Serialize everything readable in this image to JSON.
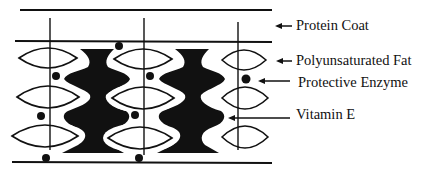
{
  "diagram": {
    "colors": {
      "ink": "#111111",
      "background": "#ffffff"
    },
    "labels": [
      {
        "id": "protein-coat",
        "text": "Protein Coat",
        "x": 296,
        "y": 18,
        "arrow": {
          "x1": 292,
          "y1": 26,
          "x2": 275,
          "y2": 26
        }
      },
      {
        "id": "polyunsaturated-fat",
        "text": "Polyunsaturated Fat",
        "x": 296,
        "y": 53,
        "arrow": {
          "x1": 292,
          "y1": 61,
          "x2": 276,
          "y2": 61
        }
      },
      {
        "id": "protective-enzyme",
        "text": "Protective Enzyme",
        "x": 298,
        "y": 75,
        "arrow": {
          "x1": 290,
          "y1": 81,
          "x2": 258,
          "y2": 81
        }
      },
      {
        "id": "vitamin-e",
        "text": "Vitamin E",
        "x": 296,
        "y": 107,
        "arrow": {
          "x1": 290,
          "y1": 118,
          "x2": 228,
          "y2": 118
        }
      }
    ],
    "membrane_lines": [
      {
        "name": "outer-top-line",
        "x1": 20,
        "y1": 10,
        "x2": 272,
        "y2": 10
      },
      {
        "name": "inner-top-line",
        "x1": 15,
        "y1": 41,
        "x2": 272,
        "y2": 42
      },
      {
        "name": "bottom-line",
        "x1": 12,
        "y1": 162,
        "x2": 272,
        "y2": 163
      }
    ],
    "vertical_lines": [
      {
        "x": 50,
        "y1": 18,
        "y2": 150
      },
      {
        "x": 144,
        "y1": 18,
        "y2": 155
      },
      {
        "x": 238,
        "y1": 22,
        "y2": 150
      }
    ],
    "fat_ellipses": [
      {
        "cx": 48,
        "cy": 58,
        "rx": 29,
        "ry": 10
      },
      {
        "cx": 48,
        "cy": 97,
        "rx": 31,
        "ry": 11
      },
      {
        "cx": 45,
        "cy": 136,
        "rx": 33,
        "ry": 11
      },
      {
        "cx": 143,
        "cy": 59,
        "rx": 29,
        "ry": 10
      },
      {
        "cx": 143,
        "cy": 98,
        "rx": 31,
        "ry": 11
      },
      {
        "cx": 140,
        "cy": 138,
        "rx": 32,
        "ry": 11
      },
      {
        "cx": 244,
        "cy": 60,
        "rx": 22,
        "ry": 10
      },
      {
        "cx": 245,
        "cy": 98,
        "rx": 23,
        "ry": 11
      },
      {
        "cx": 245,
        "cy": 137,
        "rx": 23,
        "ry": 11
      }
    ],
    "enzyme_dots": [
      {
        "cx": 119,
        "cy": 46,
        "r": 4
      },
      {
        "cx": 56,
        "cy": 76,
        "r": 4
      },
      {
        "cx": 150,
        "cy": 76,
        "r": 4
      },
      {
        "cx": 41,
        "cy": 116,
        "r": 4
      },
      {
        "cx": 135,
        "cy": 115,
        "r": 4
      },
      {
        "cx": 246,
        "cy": 79,
        "r": 4.5
      },
      {
        "cx": 46,
        "cy": 158,
        "r": 4
      },
      {
        "cx": 139,
        "cy": 158,
        "r": 4
      }
    ],
    "vitamin_e_shapes": [
      {
        "name": "vitamin-e-column-left",
        "offset_x": 0
      },
      {
        "name": "vitamin-e-column-right",
        "offset_x": 95
      }
    ]
  }
}
